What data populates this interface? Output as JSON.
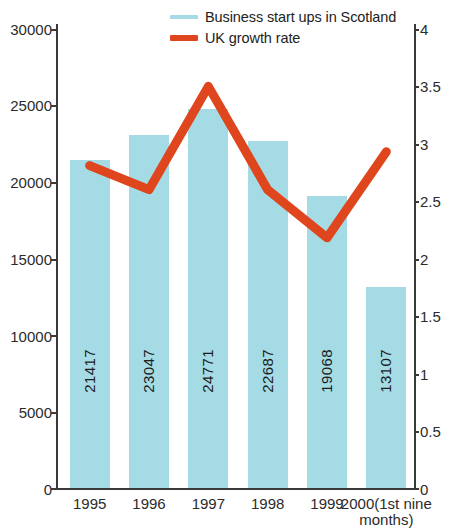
{
  "legend": {
    "items": [
      {
        "label": "Business start ups in Scotland",
        "color": "#a5dbe4",
        "type": "bar-swatch"
      },
      {
        "label": "UK growth rate",
        "color": "#df461e",
        "type": "line-swatch"
      }
    ]
  },
  "axes": {
    "left_ticks": [
      "0",
      "5000",
      "10000",
      "15000",
      "20000",
      "25000",
      "30000"
    ],
    "right_ticks": [
      "0",
      "0.5",
      "1",
      "1.5",
      "2",
      "2.5",
      "3",
      "3.5",
      "4"
    ]
  },
  "chart_data": {
    "type": "bar",
    "title": "",
    "subtitle": "",
    "xlabel": "",
    "ylabel": "",
    "y2label": "",
    "grid": false,
    "legend_position": "top-center",
    "categories": [
      "1995",
      "1996",
      "1997",
      "1998",
      "1999",
      "2000(1st nine\nmonths)"
    ],
    "ylim": [
      0,
      30000
    ],
    "y2lim": [
      0,
      4
    ],
    "ytick_values": [
      0,
      5000,
      10000,
      15000,
      20000,
      25000,
      30000
    ],
    "y2tick_values": [
      0,
      0.5,
      1,
      1.5,
      2,
      2.5,
      3,
      3.5,
      4
    ],
    "series": [
      {
        "name": "Business start ups in Scotland",
        "type": "bar",
        "axis": "left",
        "color": "#a5dbe4",
        "values": [
          21417,
          23047,
          24771,
          22687,
          19068,
          13107
        ],
        "labels": [
          "21417",
          "23047",
          "24771",
          "22687",
          "19068",
          "13107"
        ]
      },
      {
        "name": "UK growth rate",
        "type": "line",
        "axis": "right",
        "color": "#df461e",
        "values": [
          2.81,
          2.6,
          3.5,
          2.6,
          2.18,
          2.93
        ]
      }
    ]
  }
}
